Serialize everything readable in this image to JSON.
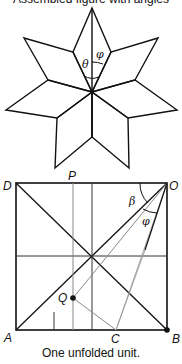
{
  "figure": {
    "top_caption_partial": "Assembled figure with angles",
    "star": {
      "description": "Six-petal star made of rhombic units meeting at a center point",
      "angle_labels": {
        "theta": "θ",
        "phi": "φ"
      }
    },
    "unit": {
      "corner_labels": {
        "D": "D",
        "P": "P",
        "O": "O",
        "A": "A",
        "C": "C",
        "B": "B",
        "Q": "Q"
      },
      "angle_labels": {
        "beta": "β",
        "phi": "φ"
      }
    },
    "caption": "One unfolded unit."
  }
}
